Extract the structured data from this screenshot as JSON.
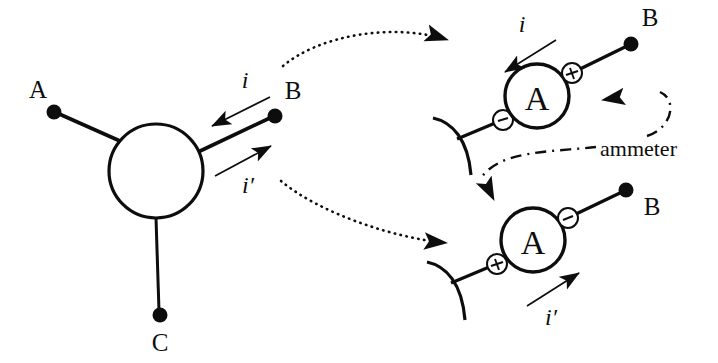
{
  "figure": {
    "background_color": "#ffffff",
    "ink_color": "#0d0d0d"
  },
  "left_panel": {
    "junction": {
      "label": "junction-node",
      "shape": "circle"
    },
    "terminals": [
      {
        "name": "terminal-a",
        "label": "A"
      },
      {
        "name": "terminal-b",
        "label": "B"
      },
      {
        "name": "terminal-c",
        "label": "C"
      }
    ],
    "currents": [
      {
        "name": "current-i",
        "label": "i",
        "direction": "into-junction"
      },
      {
        "name": "current-i-prime",
        "label": "i′",
        "direction": "out-of-junction"
      }
    ]
  },
  "right_panels": [
    {
      "name": "ammeter-top",
      "meter_glyph": "A",
      "terminal_label": "B",
      "current_label": "i",
      "left_terminal_sign": "−",
      "right_terminal_sign": "+",
      "current_direction": "leftward-away-from-meter"
    },
    {
      "name": "ammeter-bottom",
      "meter_glyph": "A",
      "terminal_label": "B",
      "current_label": "i′",
      "left_terminal_sign": "+",
      "right_terminal_sign": "−",
      "current_direction": "rightward-toward-meter"
    }
  ],
  "callout": {
    "label": "ammeter",
    "points_to": [
      "ammeter-top",
      "ammeter-bottom"
    ]
  },
  "zoom_arrows": [
    {
      "name": "zoom-arrow-top",
      "from": "junction-b-branch",
      "to": "ammeter-top"
    },
    {
      "name": "zoom-arrow-bottom",
      "from": "junction-b-branch",
      "to": "ammeter-bottom"
    }
  ]
}
